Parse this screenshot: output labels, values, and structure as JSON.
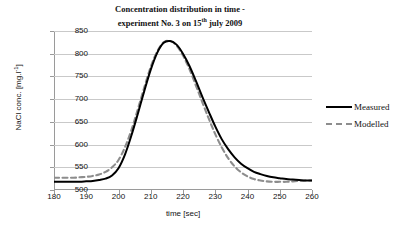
{
  "chart_data": {
    "type": "line",
    "title": "Concentration distribution in time - experiment No. 3 on 15th july 2009",
    "title_line1": "Concentration distribution in time -",
    "title_line2_pre": "experiment No. 3 on 15",
    "title_line2_sup": "th",
    "title_line2_post": " july 2009",
    "xlabel": "time [sec]",
    "ylabel_pre": "NaCl conc. [mg.l",
    "ylabel_sup": "-1",
    "ylabel_post": "]",
    "ylabel": "NaCl conc. [mg.l-1]",
    "xlim": [
      180,
      260
    ],
    "ylim": [
      500,
      850
    ],
    "xticks": [
      180,
      190,
      200,
      210,
      220,
      230,
      240,
      250,
      260
    ],
    "yticks": [
      500,
      550,
      600,
      650,
      700,
      750,
      800,
      850
    ],
    "grid": "horizontal",
    "legend_position": "right",
    "colors": {
      "measured": "#000000",
      "modelled": "#8d8d8d",
      "grid": "#c9c9c9",
      "axis": "#9a9a9a",
      "background": "#ffffff"
    },
    "x": [
      180,
      182,
      184,
      186,
      188,
      190,
      192,
      194,
      196,
      198,
      200,
      202,
      204,
      206,
      208,
      210,
      212,
      214,
      216,
      218,
      220,
      222,
      224,
      226,
      228,
      230,
      232,
      234,
      236,
      238,
      240,
      242,
      244,
      246,
      248,
      250,
      252,
      254,
      256,
      258,
      260
    ],
    "series": [
      {
        "name": "Measured",
        "style": "solid",
        "color": "#000000",
        "values": [
          518,
          518,
          518,
          518,
          518,
          519,
          520,
          522,
          525,
          532,
          548,
          578,
          620,
          668,
          718,
          765,
          802,
          824,
          828,
          820,
          800,
          773,
          740,
          705,
          672,
          640,
          612,
          590,
          572,
          558,
          548,
          540,
          535,
          531,
          528,
          526,
          524,
          523,
          522,
          521,
          521
        ]
      },
      {
        "name": "Modelled",
        "style": "dashed",
        "color": "#8d8d8d",
        "values": [
          527,
          527,
          527,
          527,
          528,
          529,
          531,
          534,
          540,
          550,
          566,
          594,
          632,
          678,
          726,
          771,
          805,
          825,
          828,
          818,
          796,
          766,
          730,
          693,
          657,
          623,
          594,
          570,
          552,
          539,
          530,
          524,
          521,
          519,
          518,
          518,
          518,
          519,
          520,
          521,
          521
        ]
      }
    ]
  },
  "legend": {
    "items": [
      {
        "label": "Measured"
      },
      {
        "label": "Modelled"
      }
    ]
  }
}
